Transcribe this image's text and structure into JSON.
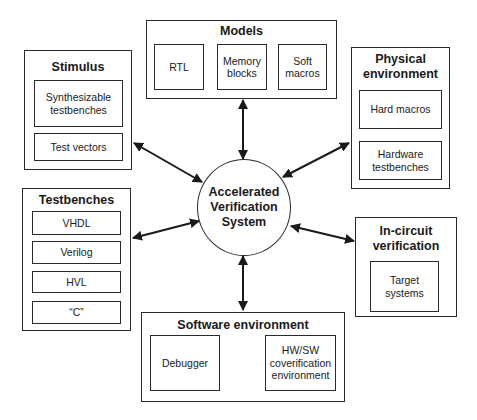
{
  "center": {
    "label": "Accelerated\nVerification\nSystem"
  },
  "groups": {
    "models": {
      "title": "Models",
      "items": [
        "RTL",
        "Memory\nblocks",
        "Soft\nmacros"
      ]
    },
    "stimulus": {
      "title": "Stimulus",
      "items": [
        "Synthesizable\ntestbenches",
        "Test vectors"
      ]
    },
    "physical": {
      "title": "Physical\nenvironment",
      "items": [
        "Hard macros",
        "Hardware\ntestbenches"
      ]
    },
    "testbenches": {
      "title": "Testbenches",
      "items": [
        "VHDL",
        "Verilog",
        "HVL",
        "“C”"
      ]
    },
    "incircuit": {
      "title": "In-circuit\nverification",
      "items": [
        "Target\nsystems"
      ]
    },
    "software": {
      "title": "Software environment",
      "items": [
        "Debugger",
        "HW/SW\ncoverification\nenvironment"
      ]
    }
  },
  "colors": {
    "line": "#2a2a2a",
    "background": "#ffffff",
    "text": "#1a1a1a"
  }
}
